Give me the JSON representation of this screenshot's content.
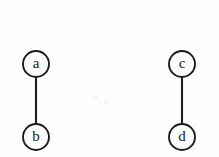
{
  "figure": {
    "background_color": "#fefefe",
    "stroke_color": "#1c1c1c",
    "node_fill_color": "#fdfdfd",
    "width": 219,
    "height": 157
  },
  "chart_data": {
    "type": "diagram",
    "diagram_kind": "undirected graph",
    "title": "",
    "xlabel": "",
    "ylabel": "",
    "grid": false,
    "legend": false,
    "nodes": [
      {
        "id": "a",
        "label": "a",
        "cx": 36,
        "cy": 64,
        "r": 13
      },
      {
        "id": "b",
        "label": "b",
        "cx": 36,
        "cy": 137,
        "r": 13
      },
      {
        "id": "c",
        "label": "c",
        "cx": 182,
        "cy": 64,
        "r": 13
      },
      {
        "id": "d",
        "label": "d",
        "cx": 182,
        "cy": 137,
        "r": 13
      }
    ],
    "edges": [
      {
        "id": "edge-ab",
        "source": "a",
        "target": "b",
        "x1": 36,
        "y1": 77,
        "x2": 36,
        "y2": 124
      },
      {
        "id": "edge-cd",
        "source": "c",
        "target": "d",
        "x1": 182,
        "y1": 77,
        "x2": 182,
        "y2": 124
      }
    ],
    "node_count": 4,
    "edge_count": 2,
    "components": 2
  },
  "specks": [
    {
      "left": 92,
      "top": 96,
      "w": 7,
      "h": 4
    },
    {
      "left": 104,
      "top": 98,
      "w": 5,
      "h": 6
    },
    {
      "left": 98,
      "top": 101,
      "w": 4,
      "h": 3
    }
  ]
}
